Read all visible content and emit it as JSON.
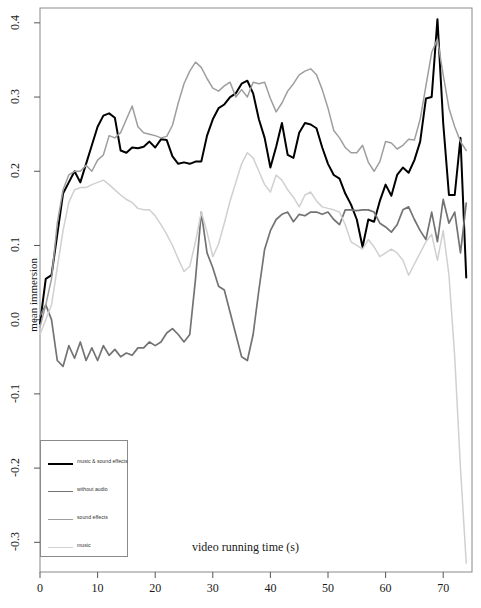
{
  "chart_data": {
    "type": "line",
    "title": "",
    "xlabel": "video running time (s)",
    "ylabel": "mean immersion",
    "xlim": [
      0,
      75
    ],
    "ylim": [
      -0.34,
      0.42
    ],
    "xticks": [
      0,
      10,
      20,
      30,
      40,
      50,
      60,
      70
    ],
    "yticks": [
      -0.3,
      -0.2,
      -0.1,
      0.0,
      0.1,
      0.2,
      0.3,
      0.4
    ],
    "ytick_labels": [
      "-0.3",
      "-0.2",
      "-0.1",
      "0.0",
      "0.1",
      "0.2",
      "0.3",
      "0.4"
    ],
    "xtick_labels": [
      "0",
      "10",
      "20",
      "30",
      "40",
      "50",
      "60",
      "70"
    ],
    "grid": false,
    "legend_position": "bottom-left",
    "series": [
      {
        "name": "music & sound effects",
        "color": "#000000",
        "width": 2.0,
        "x": [
          0,
          1,
          2,
          3,
          4,
          5,
          6,
          7,
          8,
          9,
          10,
          11,
          12,
          13,
          14,
          15,
          16,
          17,
          18,
          19,
          20,
          21,
          22,
          23,
          24,
          25,
          26,
          27,
          28,
          29,
          30,
          31,
          32,
          33,
          34,
          35,
          36,
          37,
          38,
          39,
          40,
          41,
          42,
          43,
          44,
          45,
          46,
          47,
          48,
          49,
          50,
          51,
          52,
          53,
          54,
          55,
          56,
          57,
          58,
          59,
          60,
          61,
          62,
          63,
          64,
          65,
          66,
          67,
          68,
          69,
          70,
          71,
          72,
          73,
          74
        ],
        "values": [
          -0.005,
          0.055,
          0.06,
          0.115,
          0.17,
          0.185,
          0.2,
          0.185,
          0.21,
          0.235,
          0.26,
          0.275,
          0.278,
          0.272,
          0.228,
          0.225,
          0.232,
          0.231,
          0.233,
          0.24,
          0.232,
          0.243,
          0.242,
          0.22,
          0.21,
          0.212,
          0.21,
          0.213,
          0.213,
          0.248,
          0.27,
          0.285,
          0.29,
          0.3,
          0.305,
          0.318,
          0.322,
          0.305,
          0.27,
          0.245,
          0.205,
          0.233,
          0.265,
          0.222,
          0.218,
          0.252,
          0.265,
          0.263,
          0.258,
          0.232,
          0.21,
          0.195,
          0.19,
          0.17,
          0.155,
          0.135,
          0.098,
          0.135,
          0.132,
          0.16,
          0.182,
          0.167,
          0.195,
          0.205,
          0.198,
          0.215,
          0.24,
          0.298,
          0.3,
          0.405,
          0.265,
          0.168,
          0.168,
          0.245,
          0.057
        ]
      },
      {
        "name": "without audio",
        "color": "#737373",
        "width": 1.7,
        "x": [
          0,
          1,
          2,
          3,
          4,
          5,
          6,
          7,
          8,
          9,
          10,
          11,
          12,
          13,
          14,
          15,
          16,
          17,
          18,
          19,
          20,
          21,
          22,
          23,
          24,
          25,
          26,
          27,
          28,
          29,
          30,
          31,
          32,
          33,
          34,
          35,
          36,
          37,
          38,
          39,
          40,
          41,
          42,
          43,
          44,
          45,
          46,
          47,
          48,
          49,
          50,
          51,
          52,
          53,
          54,
          55,
          56,
          57,
          58,
          59,
          60,
          61,
          62,
          63,
          64,
          65,
          66,
          67,
          68,
          69,
          70,
          71,
          72,
          73,
          74
        ],
        "values": [
          0.005,
          0.02,
          0.0,
          -0.055,
          -0.063,
          -0.035,
          -0.052,
          -0.03,
          -0.055,
          -0.038,
          -0.055,
          -0.035,
          -0.048,
          -0.04,
          -0.05,
          -0.045,
          -0.048,
          -0.038,
          -0.038,
          -0.03,
          -0.035,
          -0.03,
          -0.018,
          -0.012,
          -0.02,
          -0.03,
          -0.02,
          0.055,
          0.145,
          0.09,
          0.07,
          0.045,
          0.04,
          0.01,
          -0.02,
          -0.05,
          -0.055,
          -0.02,
          0.04,
          0.095,
          0.12,
          0.135,
          0.142,
          0.145,
          0.132,
          0.142,
          0.14,
          0.145,
          0.145,
          0.142,
          0.145,
          0.135,
          0.128,
          0.148,
          0.148,
          0.147,
          0.148,
          0.148,
          0.145,
          0.13,
          0.125,
          0.118,
          0.128,
          0.148,
          0.152,
          0.135,
          0.12,
          0.108,
          0.145,
          0.105,
          0.162,
          0.13,
          0.145,
          0.09,
          0.157
        ]
      },
      {
        "name": "sound effects",
        "color": "#9e9e9e",
        "width": 1.5,
        "x": [
          0,
          1,
          2,
          3,
          4,
          5,
          6,
          7,
          8,
          9,
          10,
          11,
          12,
          13,
          14,
          15,
          16,
          17,
          18,
          19,
          20,
          21,
          22,
          23,
          24,
          25,
          26,
          27,
          28,
          29,
          30,
          31,
          32,
          33,
          34,
          35,
          36,
          37,
          38,
          39,
          40,
          41,
          42,
          43,
          44,
          45,
          46,
          47,
          48,
          49,
          50,
          51,
          52,
          53,
          54,
          55,
          56,
          57,
          58,
          59,
          60,
          61,
          62,
          63,
          64,
          65,
          66,
          67,
          68,
          69,
          70,
          71,
          72,
          73,
          74
        ],
        "values": [
          -0.01,
          0.02,
          0.055,
          0.13,
          0.175,
          0.195,
          0.2,
          0.2,
          0.208,
          0.2,
          0.215,
          0.222,
          0.248,
          0.245,
          0.252,
          0.27,
          0.288,
          0.26,
          0.252,
          0.25,
          0.248,
          0.245,
          0.247,
          0.262,
          0.292,
          0.318,
          0.335,
          0.347,
          0.34,
          0.325,
          0.312,
          0.308,
          0.315,
          0.32,
          0.3,
          0.31,
          0.3,
          0.32,
          0.318,
          0.32,
          0.298,
          0.28,
          0.292,
          0.308,
          0.318,
          0.33,
          0.335,
          0.338,
          0.33,
          0.31,
          0.285,
          0.255,
          0.245,
          0.232,
          0.225,
          0.225,
          0.235,
          0.212,
          0.2,
          0.213,
          0.24,
          0.238,
          0.23,
          0.235,
          0.243,
          0.242,
          0.27,
          0.315,
          0.36,
          0.378,
          0.33,
          0.285,
          0.26,
          0.24,
          0.228
        ]
      },
      {
        "name": "music",
        "color": "#d0d0d0",
        "width": 1.5,
        "x": [
          0,
          1,
          2,
          3,
          4,
          5,
          6,
          7,
          8,
          9,
          10,
          11,
          12,
          13,
          14,
          15,
          16,
          17,
          18,
          19,
          20,
          21,
          22,
          23,
          24,
          25,
          26,
          27,
          28,
          29,
          30,
          31,
          32,
          33,
          34,
          35,
          36,
          37,
          38,
          39,
          40,
          41,
          42,
          43,
          44,
          45,
          46,
          47,
          48,
          49,
          50,
          51,
          52,
          53,
          54,
          55,
          56,
          57,
          58,
          59,
          60,
          61,
          62,
          63,
          64,
          65,
          66,
          67,
          68,
          69,
          70,
          71,
          72,
          73,
          74
        ],
        "values": [
          -0.02,
          0.0,
          0.02,
          0.07,
          0.12,
          0.158,
          0.175,
          0.178,
          0.178,
          0.182,
          0.185,
          0.188,
          0.182,
          0.175,
          0.168,
          0.162,
          0.158,
          0.15,
          0.148,
          0.148,
          0.14,
          0.128,
          0.115,
          0.1,
          0.082,
          0.065,
          0.072,
          0.105,
          0.145,
          0.118,
          0.085,
          0.102,
          0.13,
          0.16,
          0.185,
          0.21,
          0.225,
          0.218,
          0.2,
          0.182,
          0.172,
          0.195,
          0.188,
          0.175,
          0.165,
          0.152,
          0.168,
          0.172,
          0.16,
          0.152,
          0.15,
          0.148,
          0.145,
          0.128,
          0.105,
          0.1,
          0.095,
          0.108,
          0.098,
          0.085,
          0.09,
          0.095,
          0.09,
          0.08,
          0.06,
          0.075,
          0.09,
          0.105,
          0.115,
          0.08,
          0.12,
          0.06,
          -0.05,
          -0.2,
          -0.328
        ]
      }
    ]
  },
  "legend": {
    "entries": [
      {
        "label": "music & sound effects",
        "color": "#000000",
        "width": "2px"
      },
      {
        "label": "without audio",
        "color": "#737373",
        "width": "1.7px"
      },
      {
        "label": "sound effects",
        "color": "#9e9e9e",
        "width": "1.5px"
      },
      {
        "label": "music",
        "color": "#d0d0d0",
        "width": "1.5px"
      }
    ]
  },
  "plot_frame": {
    "color": "#8a8a8a"
  }
}
